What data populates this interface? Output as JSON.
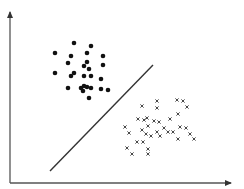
{
  "diagram": {
    "type": "linear-classifier-separation",
    "colors": {
      "axis": "#555555",
      "line": "#333333",
      "dot": "#111111",
      "cross": "#333333",
      "background": "#ffffff"
    },
    "axes": {
      "origin": [
        10,
        183
      ],
      "y_end": [
        10,
        12
      ],
      "x_end": [
        231,
        183
      ]
    },
    "boundary_line": {
      "x1": 50,
      "y1": 171,
      "x2": 153,
      "y2": 65
    },
    "class_dots": [
      [
        74,
        43
      ],
      [
        91,
        46
      ],
      [
        55,
        53
      ],
      [
        71,
        56
      ],
      [
        87,
        53
      ],
      [
        103,
        56
      ],
      [
        68,
        63
      ],
      [
        84,
        66
      ],
      [
        87,
        62
      ],
      [
        89,
        69
      ],
      [
        103,
        65
      ],
      [
        55,
        73
      ],
      [
        71,
        76
      ],
      [
        74,
        73
      ],
      [
        84,
        76
      ],
      [
        91,
        76
      ],
      [
        101,
        79
      ],
      [
        68,
        88
      ],
      [
        81,
        88
      ],
      [
        84,
        86
      ],
      [
        91,
        88
      ],
      [
        101,
        89
      ],
      [
        108,
        90
      ],
      [
        83,
        91
      ],
      [
        87,
        87
      ],
      [
        89,
        98
      ]
    ],
    "class_crosses": [
      [
        157,
        101
      ],
      [
        177,
        100
      ],
      [
        183,
        101
      ],
      [
        142,
        106
      ],
      [
        157,
        108
      ],
      [
        187,
        107
      ],
      [
        178,
        114
      ],
      [
        170,
        119
      ],
      [
        138,
        119
      ],
      [
        144,
        120
      ],
      [
        147,
        118
      ],
      [
        154,
        121
      ],
      [
        159,
        122
      ],
      [
        125,
        127
      ],
      [
        148,
        126
      ],
      [
        164,
        128
      ],
      [
        180,
        127
      ],
      [
        186,
        128
      ],
      [
        142,
        130
      ],
      [
        129,
        133
      ],
      [
        146,
        134
      ],
      [
        157,
        132
      ],
      [
        168,
        132
      ],
      [
        173,
        132
      ],
      [
        151,
        136
      ],
      [
        160,
        136
      ],
      [
        190,
        134
      ],
      [
        178,
        139
      ],
      [
        194,
        139
      ],
      [
        137,
        142
      ],
      [
        143,
        142
      ],
      [
        127,
        148
      ],
      [
        148,
        149
      ],
      [
        132,
        154
      ],
      [
        148,
        154
      ]
    ]
  }
}
